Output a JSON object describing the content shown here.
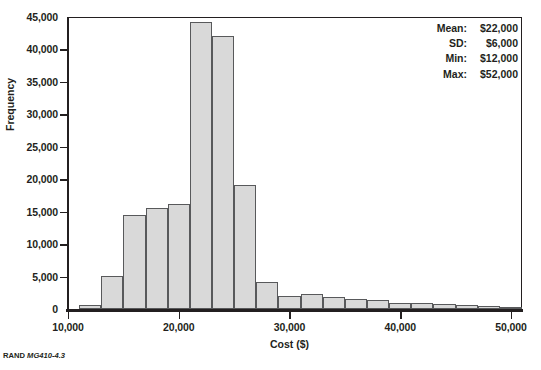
{
  "chart_data": {
    "type": "bar",
    "title": "",
    "subtitle": "",
    "xlabel": "Cost ($)",
    "ylabel": "Frequency",
    "xlim": [
      10000,
      51000
    ],
    "ylim": [
      0,
      45000
    ],
    "grid": false,
    "legend_position": "none",
    "bin_width": 2000,
    "x_ticks": [
      10000,
      20000,
      30000,
      40000,
      50000
    ],
    "x_tick_labels": [
      "10,000",
      "20,000",
      "30,000",
      "40,000",
      "50,000"
    ],
    "y_ticks": [
      0,
      5000,
      10000,
      15000,
      20000,
      25000,
      30000,
      35000,
      40000,
      45000
    ],
    "y_tick_labels": [
      "0",
      "5,000",
      "10,000",
      "15,000",
      "20,000",
      "25,000",
      "30,000",
      "35,000",
      "40,000",
      "45,000"
    ],
    "bar_fill_color": "#d9d9d9",
    "bar_edge_color": "#58595b",
    "bins": [
      {
        "x0": 11000,
        "x1": 13000,
        "value": 600
      },
      {
        "x0": 13000,
        "x1": 15000,
        "value": 5100
      },
      {
        "x0": 15000,
        "x1": 17000,
        "value": 14500
      },
      {
        "x0": 17000,
        "x1": 19000,
        "value": 15500
      },
      {
        "x0": 19000,
        "x1": 21000,
        "value": 16200
      },
      {
        "x0": 21000,
        "x1": 23000,
        "value": 44300
      },
      {
        "x0": 23000,
        "x1": 25000,
        "value": 42000
      },
      {
        "x0": 25000,
        "x1": 27000,
        "value": 19100
      },
      {
        "x0": 27000,
        "x1": 29000,
        "value": 4200
      },
      {
        "x0": 29000,
        "x1": 31000,
        "value": 2000
      },
      {
        "x0": 31000,
        "x1": 33000,
        "value": 2300
      },
      {
        "x0": 33000,
        "x1": 35000,
        "value": 1800
      },
      {
        "x0": 35000,
        "x1": 37000,
        "value": 1600
      },
      {
        "x0": 37000,
        "x1": 39000,
        "value": 1400
      },
      {
        "x0": 39000,
        "x1": 41000,
        "value": 1000
      },
      {
        "x0": 41000,
        "x1": 43000,
        "value": 900
      },
      {
        "x0": 43000,
        "x1": 45000,
        "value": 800
      },
      {
        "x0": 45000,
        "x1": 47000,
        "value": 600
      },
      {
        "x0": 47000,
        "x1": 49000,
        "value": 400
      },
      {
        "x0": 49000,
        "x1": 51000,
        "value": 250
      }
    ]
  },
  "annotations": {
    "stats": [
      {
        "key": "Mean:",
        "value": "$22,000"
      },
      {
        "key": "SD:",
        "value": "$6,000"
      },
      {
        "key": "Min:",
        "value": "$12,000"
      },
      {
        "key": "Max:",
        "value": "$52,000"
      }
    ]
  },
  "credit": {
    "label": "RAND",
    "id": "MG410-4.3"
  }
}
